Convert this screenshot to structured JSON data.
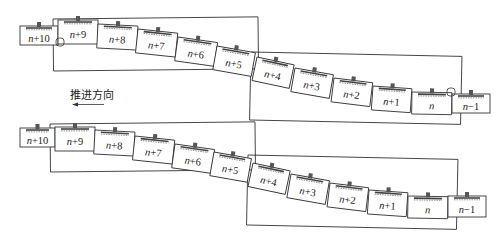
{
  "direction_label": "推进方向",
  "rings": [
    "n+10",
    "n+9",
    "n+8",
    "n+7",
    "n+6",
    "n+5",
    "n+4",
    "n+3",
    "n+2",
    "n+1",
    "n",
    "n−1"
  ],
  "panels": [
    {
      "name": "top-stage",
      "highlighted_joint": "n / n−1"
    },
    {
      "name": "bottom-stage",
      "highlighted_joint": "n+5 / n+4"
    }
  ],
  "colors": {
    "stroke": "#333333",
    "background": "#ffffff"
  }
}
